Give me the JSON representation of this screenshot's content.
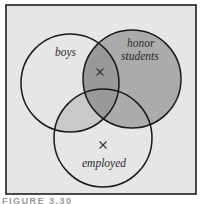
{
  "diagram": {
    "type": "venn",
    "sets": [
      {
        "id": "boys",
        "label": "boys",
        "cx": 70,
        "cy": 83,
        "r": 49
      },
      {
        "id": "honor",
        "label_line1": "honor",
        "label_line2": "students",
        "cx": 132,
        "cy": 79,
        "r": 49
      },
      {
        "id": "employed",
        "label": "employed",
        "cx": 103,
        "cy": 138,
        "r": 49
      }
    ],
    "marks": [
      {
        "symbol": "×",
        "region": "boys ∩ honor students (not employed)",
        "x": 100,
        "y": 72
      },
      {
        "symbol": "×",
        "region": "employed only",
        "x": 103,
        "y": 145
      }
    ],
    "shaded_regions": [
      {
        "region": "honor students",
        "shade": "medium"
      },
      {
        "region": "boys ∩ employed",
        "shade": "light"
      },
      {
        "region": "boys ∩ honor students",
        "shade": "dark"
      }
    ],
    "colors": {
      "background": "#e6e6e6",
      "frame": "#1e1e1e",
      "circle_stroke": "#1a1a1a",
      "light_shade": "#c9c9c9",
      "medium_shade": "#ababab",
      "dark_shade": "#999999"
    }
  },
  "labels": {
    "boys": "boys",
    "honor_line1": "honor",
    "honor_line2": "students",
    "employed": "employed"
  },
  "caption": "FIGURE 3.30"
}
